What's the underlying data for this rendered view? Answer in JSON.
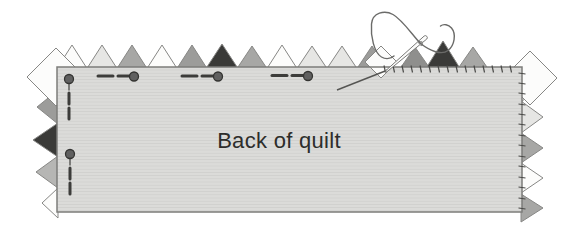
{
  "diagram": {
    "label": "Back of quilt",
    "palette": {
      "white": "#fcfcfb",
      "light": "#e6e6e4",
      "medium": "#a7a7a5",
      "gray2": "#9c9c9a",
      "mediumDark": "#8f8f8d",
      "dark": "#3a3a38",
      "lightMedium": "#b6b6b4",
      "outline": "#878785",
      "quiltFill": "#dbdbd9",
      "quiltLine": "#cfcfcd",
      "border": "#7c7c7a",
      "stitch": "#4a4a48",
      "pinDash": "#3c3c3a",
      "pinHeadFill": "#606060",
      "pinHeadStroke": "#343432",
      "thread": "#6b6b69",
      "needleFill": "#fbfbfa",
      "needleStroke": "#797977",
      "needleTail": "#555553",
      "text": "#2d2d2b"
    },
    "quilt": {
      "x": 57,
      "y": 67,
      "w": 465,
      "h": 145
    },
    "top_points": [
      {
        "x": 72,
        "py": 45,
        "half": 16,
        "shade": "white"
      },
      {
        "x": 102,
        "py": 45,
        "half": 16,
        "shade": "light"
      },
      {
        "x": 132,
        "py": 45,
        "half": 16,
        "shade": "medium"
      },
      {
        "x": 162,
        "py": 45,
        "half": 16,
        "shade": "white"
      },
      {
        "x": 192,
        "py": 45,
        "half": 16,
        "shade": "gray2"
      },
      {
        "x": 222,
        "py": 44,
        "half": 17,
        "shade": "dark"
      },
      {
        "x": 252,
        "py": 46,
        "half": 16,
        "shade": "medium"
      },
      {
        "x": 282,
        "py": 45,
        "half": 16,
        "shade": "white"
      },
      {
        "x": 312,
        "py": 46,
        "half": 16,
        "shade": "light"
      },
      {
        "x": 342,
        "py": 46,
        "half": 16,
        "shade": "light"
      },
      {
        "x": 372,
        "py": 46,
        "half": 16,
        "shade": "gray2"
      },
      {
        "x": 415,
        "py": 47,
        "half": 16,
        "shade": "mediumDark"
      },
      {
        "x": 443,
        "py": 41,
        "half": 18,
        "shade": "dark"
      },
      {
        "x": 473,
        "py": 47,
        "half": 16,
        "shade": "medium"
      }
    ],
    "top_base_y": 70,
    "left_points": [
      {
        "px": 37,
        "py": 107,
        "half": 17,
        "shade": "gray2"
      },
      {
        "px": 33,
        "py": 140,
        "half": 17,
        "shade": "dark"
      },
      {
        "px": 36,
        "py": 172,
        "half": 16,
        "shade": "lightMedium"
      },
      {
        "px": 42,
        "py": 203,
        "half": 15,
        "shade": "white"
      }
    ],
    "left_base_x": 58,
    "right_points": [
      {
        "px": 542,
        "py": 85,
        "half": 17,
        "shade": "white"
      },
      {
        "px": 543,
        "py": 117,
        "half": 16,
        "shade": "light"
      },
      {
        "px": 543,
        "py": 148,
        "half": 15,
        "shade": "medium"
      },
      {
        "px": 543,
        "py": 178,
        "half": 15,
        "shade": "white"
      },
      {
        "px": 543,
        "py": 208,
        "half": 14,
        "shade": "medium"
      }
    ],
    "right_base_x": 521,
    "corner_diamonds": [
      {
        "cx": 56,
        "cy": 77,
        "r": 29,
        "shade": "white"
      },
      {
        "cx": 530,
        "cy": 78,
        "r": 27,
        "shade": "white"
      }
    ],
    "flipped_point": {
      "cx": 381,
      "cy": 62,
      "r": 16,
      "shade": "white"
    },
    "pins_horizontal": {
      "heads": [
        [
          134,
          76.5
        ],
        [
          218,
          76.5
        ],
        [
          308,
          76
        ]
      ],
      "dash_offsets": [
        [
          -36,
          -21
        ],
        [
          -16,
          -4.5
        ]
      ],
      "head_radius": 4.5,
      "dash_width": 3
    },
    "pins_vertical": {
      "heads": [
        [
          69,
          79
        ],
        [
          70,
          154
        ]
      ],
      "dash_offsets": [
        [
          14,
          25
        ],
        [
          29,
          40
        ]
      ],
      "stem_length": 7,
      "head_radius": 4.5,
      "dash_width": 3
    },
    "stitches_top": {
      "xs": [
        384,
        393,
        402,
        411,
        420,
        429,
        438,
        447,
        456,
        465,
        474,
        483,
        492,
        501,
        510
      ],
      "y0": 65.5,
      "y1": 72.5,
      "tilt": 1.5
    },
    "stitches_right": {
      "ys": [
        73,
        83,
        93,
        104,
        114,
        124,
        135,
        145,
        156,
        166,
        177,
        187,
        198,
        208
      ],
      "x0": 518.5,
      "x1": 525.5,
      "tilt": 1
    },
    "needle": {
      "tail": [
        337,
        90,
        389,
        69.5
      ],
      "body_path": "M 386.5,72.1 L 426.8,39.0 A 2,2 0 0 0 424.2,36.0 L 385.5,70.9 Z",
      "eye": {
        "cx": 420.5,
        "cy": 43.5,
        "rx": 1.2,
        "ry": 2.6,
        "angle": -40
      },
      "knot": {
        "cx": 421,
        "cy": 43,
        "r": 1.9
      }
    },
    "thread_paths": [
      "M 420.5,43.5 C 429,50 441,56 448,50.5 C 454.5,45.5 456.5,34 451.5,28 C 448.5,24.5 443.5,23.5 440.5,26",
      "M 420.5,43.5 C 412,34.5 402,19.5 393,14.5 C 384.5,9.8 372.5,12.5 371.5,24 C 370.5,36 374,52.5 381.5,57 C 386,59.5 391,58.5 394,56"
    ],
    "label_pos": {
      "x": 279,
      "y": 148
    }
  }
}
